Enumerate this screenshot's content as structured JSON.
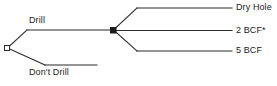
{
  "diagram": {
    "type": "decision-tree",
    "line_color": "#2b2b2b",
    "text_color": "#1b1b1b",
    "background": "#ffffff",
    "decision_node": {
      "shape": "square-open",
      "x": 7,
      "y": 48
    },
    "chance_node": {
      "shape": "square-filled",
      "x": 113,
      "y": 30
    },
    "branches": {
      "drill": {
        "label": "Drill"
      },
      "dont_drill": {
        "label": "Don't Drill"
      }
    },
    "outcomes": [
      {
        "label": "Dry Hole"
      },
      {
        "label": "2 BCF*"
      },
      {
        "label": "5 BCF"
      }
    ]
  }
}
